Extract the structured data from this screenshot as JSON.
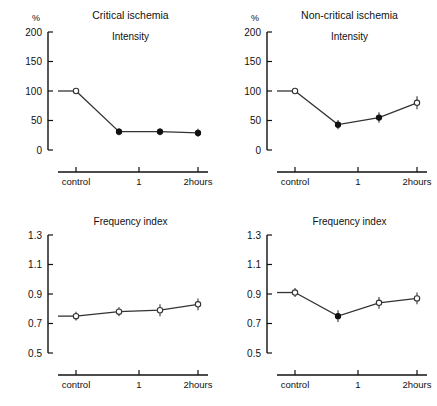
{
  "figure": {
    "panels": [
      {
        "id": "critical-intensity",
        "title": "Critical ischemia",
        "subtitle": "Intensity",
        "unit": "%",
        "ylabel": "",
        "xlabel": "",
        "yticks": [
          "200",
          "150",
          "100",
          "50",
          "0"
        ],
        "ytick_values": [
          200,
          150,
          100,
          50,
          0
        ],
        "ylim": [
          0,
          200
        ],
        "xticks": [
          "control",
          "1",
          "2hours"
        ],
        "points": [
          {
            "x": "control",
            "value": 100,
            "error": 0,
            "marker": "open"
          },
          {
            "x": "0.5",
            "value": 31,
            "error": 6,
            "marker": "filled"
          },
          {
            "x": "1",
            "value": 31,
            "error": 6,
            "marker": "filled"
          },
          {
            "x": "2hours",
            "value": 29,
            "error": 7,
            "marker": "filled"
          }
        ]
      },
      {
        "id": "noncritical-intensity",
        "title": "Non-critical ischemia",
        "subtitle": "Intensity",
        "unit": "%",
        "ylabel": "",
        "xlabel": "",
        "yticks": [
          "200",
          "150",
          "100",
          "50",
          "0"
        ],
        "ytick_values": [
          200,
          150,
          100,
          50,
          0
        ],
        "ylim": [
          0,
          200
        ],
        "xticks": [
          "control",
          "1",
          "2hours"
        ],
        "points": [
          {
            "x": "control",
            "value": 100,
            "error": 0,
            "marker": "open"
          },
          {
            "x": "0.5",
            "value": 43,
            "error": 8,
            "marker": "filled"
          },
          {
            "x": "1",
            "value": 55,
            "error": 9,
            "marker": "filled"
          },
          {
            "x": "2hours",
            "value": 80,
            "error": 11,
            "marker": "open"
          }
        ]
      },
      {
        "id": "critical-frequency",
        "title": "",
        "subtitle": "Frequency index",
        "unit": "",
        "ylabel": "",
        "xlabel": "",
        "yticks": [
          "1.3",
          "1.1",
          "0.9",
          "0.7",
          "0.5"
        ],
        "ytick_values": [
          1.3,
          1.1,
          0.9,
          0.7,
          0.5
        ],
        "ylim": [
          0.5,
          1.3
        ],
        "xticks": [
          "control",
          "1",
          "2hours"
        ],
        "points": [
          {
            "x": "control",
            "value": 0.75,
            "error": 0.03,
            "marker": "open"
          },
          {
            "x": "0.5",
            "value": 0.78,
            "error": 0.03,
            "marker": "open"
          },
          {
            "x": "1",
            "value": 0.79,
            "error": 0.04,
            "marker": "open"
          },
          {
            "x": "2hours",
            "value": 0.83,
            "error": 0.04,
            "marker": "open"
          }
        ]
      },
      {
        "id": "noncritical-frequency",
        "title": "",
        "subtitle": "Frequency index",
        "unit": "",
        "ylabel": "",
        "xlabel": "",
        "yticks": [
          "1.3",
          "1.1",
          "0.9",
          "0.7",
          "0.5"
        ],
        "ytick_values": [
          1.3,
          1.1,
          0.9,
          0.7,
          0.5
        ],
        "ylim": [
          0.5,
          1.3
        ],
        "xticks": [
          "control",
          "1",
          "2hours"
        ],
        "points": [
          {
            "x": "control",
            "value": 0.91,
            "error": 0.03,
            "marker": "open"
          },
          {
            "x": "0.5",
            "value": 0.75,
            "error": 0.04,
            "marker": "filled"
          },
          {
            "x": "1",
            "value": 0.84,
            "error": 0.04,
            "marker": "open"
          },
          {
            "x": "2hours",
            "value": 0.87,
            "error": 0.04,
            "marker": "open"
          }
        ]
      }
    ]
  },
  "chart_data": [
    {
      "type": "line",
      "title": "Critical ischemia",
      "subtitle": "Intensity",
      "xlabel": "",
      "ylabel": "%",
      "ylim": [
        0,
        200
      ],
      "yticks": [
        0,
        50,
        100,
        150,
        200
      ],
      "grid": false,
      "legend": "none",
      "categories": [
        "control",
        "0.5",
        "1",
        "2hours"
      ],
      "tick_categories": [
        "control",
        "1",
        "2hours"
      ],
      "series": [
        {
          "name": "Intensity",
          "values": [
            100,
            31,
            31,
            29
          ],
          "errors": [
            0,
            6,
            6,
            7
          ],
          "markers": [
            "open",
            "filled",
            "filled",
            "filled"
          ]
        }
      ]
    },
    {
      "type": "line",
      "title": "Non-critical ischemia",
      "subtitle": "Intensity",
      "xlabel": "",
      "ylabel": "%",
      "ylim": [
        0,
        200
      ],
      "yticks": [
        0,
        50,
        100,
        150,
        200
      ],
      "grid": false,
      "legend": "none",
      "categories": [
        "control",
        "0.5",
        "1",
        "2hours"
      ],
      "tick_categories": [
        "control",
        "1",
        "2hours"
      ],
      "series": [
        {
          "name": "Intensity",
          "values": [
            100,
            43,
            55,
            80
          ],
          "errors": [
            0,
            8,
            9,
            11
          ],
          "markers": [
            "open",
            "filled",
            "filled",
            "open"
          ]
        }
      ]
    },
    {
      "type": "line",
      "title": "",
      "subtitle": "Frequency index",
      "xlabel": "",
      "ylabel": "",
      "ylim": [
        0.5,
        1.3
      ],
      "yticks": [
        0.5,
        0.7,
        0.9,
        1.1,
        1.3
      ],
      "grid": false,
      "legend": "none",
      "categories": [
        "control",
        "0.5",
        "1",
        "2hours"
      ],
      "tick_categories": [
        "control",
        "1",
        "2hours"
      ],
      "series": [
        {
          "name": "Frequency index",
          "values": [
            0.75,
            0.78,
            0.79,
            0.83
          ],
          "errors": [
            0.03,
            0.03,
            0.04,
            0.04
          ],
          "markers": [
            "open",
            "open",
            "open",
            "open"
          ]
        }
      ]
    },
    {
      "type": "line",
      "title": "",
      "subtitle": "Frequency index",
      "xlabel": "",
      "ylabel": "",
      "ylim": [
        0.5,
        1.3
      ],
      "yticks": [
        0.5,
        0.7,
        0.9,
        1.1,
        1.3
      ],
      "grid": false,
      "legend": "none",
      "categories": [
        "control",
        "0.5",
        "1",
        "2hours"
      ],
      "tick_categories": [
        "control",
        "1",
        "2hours"
      ],
      "series": [
        {
          "name": "Frequency index",
          "values": [
            0.91,
            0.75,
            0.84,
            0.87
          ],
          "errors": [
            0.03,
            0.04,
            0.04,
            0.04
          ],
          "markers": [
            "open",
            "filled",
            "open",
            "open"
          ]
        }
      ]
    }
  ]
}
